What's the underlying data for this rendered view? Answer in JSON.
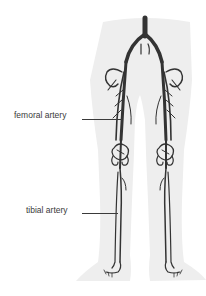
{
  "diagram": {
    "colors": {
      "background": "#ffffff",
      "silhouette": "#eeeeee",
      "artery": "#333333",
      "label_text": "#3a3a3a"
    },
    "labels": [
      {
        "id": "femoral",
        "text": "femoral artery"
      },
      {
        "id": "tibial",
        "text": "tibial artery"
      }
    ]
  }
}
